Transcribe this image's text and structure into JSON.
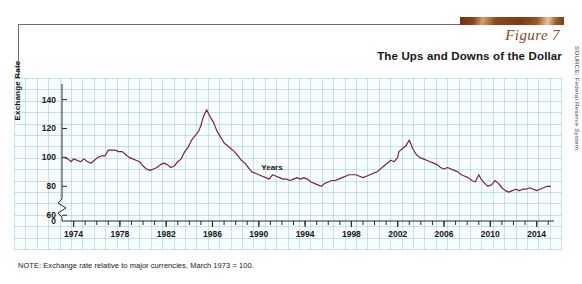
{
  "header": {
    "figure_label": "Figure 7",
    "title": "The Ups and Downs of the Dollar",
    "accent_color": "#8a4a22",
    "rule_color": "#6d6d6d"
  },
  "note": "NOTE: Exchange rate relative to major currencies, March 1973  =  100.",
  "source": "SOURCE: Federal Reserve System.",
  "chart_data": {
    "type": "line",
    "title": "The Ups and Downs of the Dollar",
    "xlabel": "Years",
    "ylabel": "Exchange Rate",
    "line_color": "#7a2540",
    "grid": true,
    "grid_color": "#78bec8",
    "plot_background": "#f7fcfd",
    "legend": "none",
    "xlim": [
      1973,
      2015.5
    ],
    "ylim": [
      56,
      148
    ],
    "y_axis_break": true,
    "y_break_between": [
      0,
      60
    ],
    "yticks": [
      0,
      60,
      80,
      100,
      120,
      140
    ],
    "ytick_labels": [
      "0",
      "60",
      "80",
      "100",
      "120",
      "140"
    ],
    "xticks": [
      1974,
      1978,
      1982,
      1986,
      1990,
      1994,
      1998,
      2002,
      2006,
      2010,
      2014
    ],
    "xtick_labels": [
      "1974",
      "1978",
      "1982",
      "1986",
      "1990",
      "1994",
      "1998",
      "2002",
      "2006",
      "2010",
      "2014"
    ],
    "x_minor_tick_interval": 1,
    "series": [
      {
        "name": "Trade-weighted dollar index",
        "x": [
          1973.2,
          1973.5,
          1973.8,
          1974.0,
          1974.3,
          1974.6,
          1974.9,
          1975.2,
          1975.5,
          1975.8,
          1976.1,
          1976.4,
          1976.7,
          1977.0,
          1977.3,
          1977.6,
          1977.9,
          1978.2,
          1978.5,
          1978.8,
          1979.1,
          1979.4,
          1979.7,
          1980.0,
          1980.3,
          1980.6,
          1980.9,
          1981.2,
          1981.5,
          1981.8,
          1982.1,
          1982.4,
          1982.7,
          1983.0,
          1983.3,
          1983.6,
          1983.9,
          1984.2,
          1984.5,
          1984.8,
          1985.0,
          1985.2,
          1985.5,
          1985.8,
          1986.1,
          1986.4,
          1986.7,
          1987.0,
          1987.3,
          1987.6,
          1987.9,
          1988.2,
          1988.5,
          1988.8,
          1989.1,
          1989.4,
          1989.7,
          1990.0,
          1990.3,
          1990.6,
          1990.9,
          1991.2,
          1991.5,
          1991.8,
          1992.1,
          1992.4,
          1992.7,
          1993.0,
          1993.3,
          1993.6,
          1993.9,
          1994.2,
          1994.5,
          1994.8,
          1995.1,
          1995.4,
          1995.7,
          1996.0,
          1996.3,
          1996.6,
          1996.9,
          1997.2,
          1997.5,
          1997.8,
          1998.1,
          1998.4,
          1998.7,
          1999.0,
          1999.3,
          1999.6,
          1999.9,
          2000.2,
          2000.5,
          2000.8,
          2001.1,
          2001.4,
          2001.7,
          2002.0,
          2002.1,
          2002.4,
          2002.7,
          2003.0,
          2003.3,
          2003.6,
          2003.9,
          2004.2,
          2004.5,
          2004.8,
          2005.1,
          2005.4,
          2005.7,
          2006.0,
          2006.3,
          2006.6,
          2006.9,
          2007.2,
          2007.5,
          2007.8,
          2008.1,
          2008.4,
          2008.7,
          2009.0,
          2009.2,
          2009.5,
          2009.8,
          2010.1,
          2010.4,
          2010.7,
          2011.0,
          2011.3,
          2011.6,
          2011.9,
          2012.2,
          2012.5,
          2012.8,
          2013.1,
          2013.4,
          2013.7,
          2014.0,
          2014.3,
          2014.6,
          2014.9,
          2015.2
        ],
        "y": [
          100,
          99,
          97,
          99,
          98,
          97,
          99,
          97,
          96,
          98,
          100,
          101,
          101,
          105,
          105,
          105,
          104,
          104,
          102,
          100,
          99,
          98,
          97,
          94,
          92,
          91,
          92,
          93,
          95,
          96,
          95,
          93,
          94,
          97,
          99,
          104,
          107,
          112,
          115,
          118,
          122,
          128,
          133,
          128,
          124,
          118,
          114,
          110,
          108,
          106,
          104,
          101,
          98,
          96,
          93,
          90,
          89,
          88,
          87,
          86,
          85,
          88,
          87,
          86,
          85,
          85,
          84,
          85,
          86,
          85,
          86,
          85,
          83,
          82,
          81,
          80,
          82,
          83,
          84,
          84,
          85,
          86,
          87,
          88,
          88,
          88,
          87,
          86,
          87,
          88,
          89,
          90,
          92,
          94,
          96,
          98,
          97,
          100,
          104,
          106,
          108,
          112,
          106,
          102,
          100,
          99,
          98,
          97,
          96,
          95,
          93,
          92,
          93,
          92,
          91,
          90,
          88,
          87,
          86,
          84,
          83,
          88,
          85,
          82,
          80,
          81,
          84,
          82,
          79,
          77,
          76,
          77,
          78,
          77,
          78,
          78,
          79,
          78,
          77,
          78,
          79,
          80,
          80
        ]
      }
    ],
    "annotations": [
      "Peak of roughly 133 in early 1985",
      "Secondary peak of roughly 112 in early 2002",
      "Trough of roughly 76 in 2011"
    ]
  }
}
